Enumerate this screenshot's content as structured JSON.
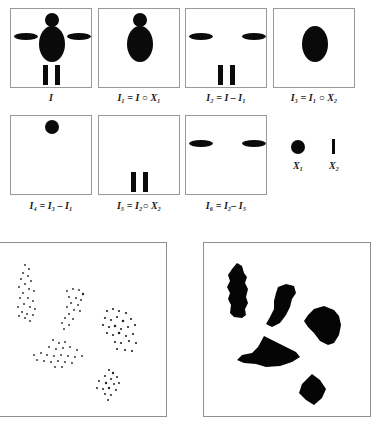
{
  "figure": {
    "top_row": [
      {
        "id": "I",
        "label": "I"
      },
      {
        "id": "I1",
        "label": "I₁ = I ○ X₁"
      },
      {
        "id": "I2",
        "label": "I₂ = I – I₁"
      },
      {
        "id": "I3",
        "label": "I₃ = I₁ ○ X₂"
      }
    ],
    "second_row": [
      {
        "id": "I4",
        "label": "I₄ = I₃ – I₁"
      },
      {
        "id": "I5",
        "label": "I₅ = I₂○ X₂"
      },
      {
        "id": "I6",
        "label": "I₆ = I₂– I₅"
      }
    ],
    "structuring_elements": [
      {
        "id": "X1",
        "label": "X₁",
        "shape": "disk"
      },
      {
        "id": "X2",
        "label": "X₂",
        "shape": "vertical-line"
      }
    ],
    "bottom_panels": [
      {
        "id": "scatter-points",
        "description": "sparse point clusters"
      },
      {
        "id": "filled-regions",
        "description": "filled blob regions"
      }
    ],
    "colors": {
      "foreground": "#0a0a0a",
      "border": "#9a9a9a",
      "background": "#ffffff"
    }
  }
}
